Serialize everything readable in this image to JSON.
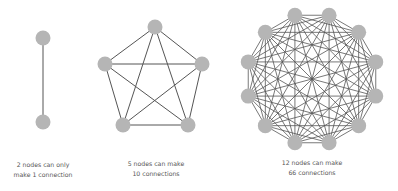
{
  "colors": {
    "node": "#b5b5b5",
    "edge": "#555555",
    "text": "#555555"
  },
  "graphs": [
    {
      "name": "two-node-graph",
      "nodes": [
        [
          43,
          38
        ],
        [
          43,
          122
        ]
      ],
      "node_radius": 7.5,
      "caption_lines": [
        "2 nodes can only",
        "make 1 connection"
      ],
      "caption_x": 43
    },
    {
      "name": "five-node-graph",
      "nodes": [
        [
          155,
          27
        ],
        [
          202,
          64
        ],
        [
          188,
          125
        ],
        [
          123,
          125
        ],
        [
          105,
          64
        ]
      ],
      "node_radius": 7.5,
      "caption_lines": [
        "5 nodes can make",
        "10 connections"
      ],
      "caption_x": 156
    },
    {
      "name": "twelve-node-graph",
      "center": [
        312,
        79
      ],
      "radius": 66,
      "count": 12,
      "angle_offset_deg": 15,
      "node_radius": 7.5,
      "caption_lines": [
        "12 nodes can make",
        "66 connections"
      ],
      "caption_x": 312
    }
  ]
}
